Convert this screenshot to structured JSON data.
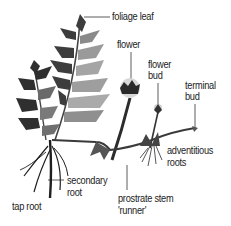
{
  "diagram": {
    "colors": {
      "ink": "#222222",
      "leaf_dark": "#3a3a3a",
      "leaf_mid": "#777777",
      "leaf_light": "#b5b5b5",
      "bloom": "#d8d8d8",
      "background": "#ffffff"
    },
    "labels": {
      "foliage_leaf": "foliage leaf",
      "flower": "flower",
      "flower_bud_1": "flower",
      "flower_bud_2": "bud",
      "terminal_bud_1": "terminal",
      "terminal_bud_2": "bud",
      "adventitious_roots_1": "adventitious",
      "adventitious_roots_2": "roots",
      "secondary_root_1": "secondary",
      "secondary_root_2": "root",
      "prostrate_stem_1": "prostrate stem",
      "prostrate_stem_2": "'runner'",
      "tap_root": "tap root"
    }
  }
}
